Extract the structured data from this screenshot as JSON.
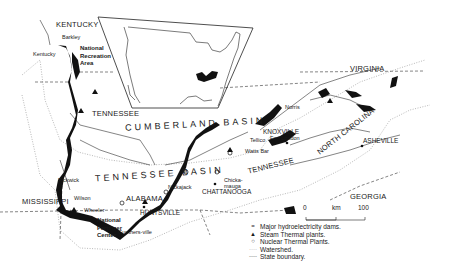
{
  "map": {
    "states": {
      "kentucky": "KENTUCKY",
      "tennessee_north": "TENNESSEE",
      "tennessee_east": "TENNESSEE",
      "virginia": "VIRGINIA",
      "north_carolina": "NORTH CAROLINA",
      "georgia": "GEORGIA",
      "alabama": "ALABAMA",
      "mississippi": "MISSISSIPPI"
    },
    "basins": {
      "cumberland": "CUMBERLAND BASIN",
      "tennessee": "TENNESSEE BASIN"
    },
    "cities": {
      "knoxville": "KNOXVILLE",
      "asheville": "ASHEVILLE",
      "chattanooga": "CHATTANOOGA",
      "huntsville": "HUNTSVILLE"
    },
    "dams": {
      "barkley": "Barkley",
      "kentucky": "Kentucky",
      "norris": "Norris",
      "fort_loudon": "Fort Loudon",
      "tellico": "Tellico",
      "watts_bar": "Watts Bar",
      "chickamauga_1": "Chicka-",
      "chickamauga_2": "mauga",
      "nickajack": "Nickajack",
      "pickwick": "Pickwick",
      "wilson": "Wilson",
      "wheeler": "Wheeler",
      "guntersville": "Gunthers-ville"
    },
    "areas": {
      "recreation_1": "National",
      "recreation_2": "Recreation",
      "recreation_3": "Area",
      "fertilizer_1": "National",
      "fertilizer_2": "Fertilizer",
      "fertilizer_3": "Center"
    },
    "scale": {
      "start": "0",
      "unit": "km",
      "end": "100"
    }
  },
  "legend": [
    {
      "symbol": "=",
      "label": "Major hydroelectricity dams."
    },
    {
      "symbol": "▲",
      "label": "Steam Thermal plants."
    },
    {
      "symbol": "○",
      "label": "Nuclear Thermal Plants."
    },
    {
      "symbol": "····",
      "label": "Watershed."
    },
    {
      "symbol": "----",
      "label": "State boundary."
    }
  ]
}
